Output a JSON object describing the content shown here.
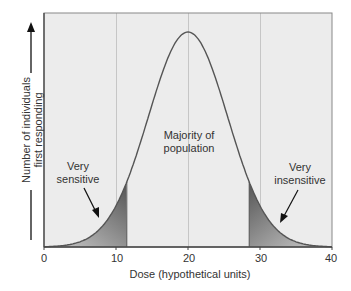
{
  "chart_data": {
    "type": "area",
    "title": "",
    "xlabel": "Dose (hypothetical units)",
    "ylabel_lines": [
      "Number of individuals",
      "first responding"
    ],
    "xlim": [
      0,
      40
    ],
    "x_ticks": [
      0,
      10,
      20,
      30,
      40
    ],
    "x_tick_labels": [
      "0",
      "10",
      "20",
      "30",
      "40"
    ],
    "grid": {
      "vertical": [
        10,
        20,
        30
      ],
      "horizontal": false
    },
    "distribution": {
      "shape": "normal",
      "mean": 20,
      "sd": 5.5
    },
    "shaded_regions": [
      {
        "name": "very-sensitive",
        "from": 0,
        "to": 11.5
      },
      {
        "name": "very-insensitive",
        "from": 28.5,
        "to": 40
      }
    ],
    "annotations": [
      {
        "lines": [
          "Very",
          "sensitive"
        ],
        "target_dose": 7.5
      },
      {
        "lines": [
          "Majority of",
          "population"
        ],
        "target_dose": 20
      },
      {
        "lines": [
          "Very",
          "insensitive"
        ],
        "target_dose": 33
      }
    ],
    "colors": {
      "background": "#ececec",
      "curve": "#555555",
      "shade_dark": "#5e5e5e",
      "shade_light": "#c4c4c4",
      "grid": "#c8c8c8"
    }
  },
  "labels": {
    "x_axis": "Dose (hypothetical units)",
    "y_axis_line1": "Number of individuals",
    "y_axis_line2": "first responding",
    "ticks": [
      "0",
      "10",
      "20",
      "30",
      "40"
    ],
    "sensitive_1": "Very",
    "sensitive_2": "sensitive",
    "majority_1": "Majority of",
    "majority_2": "population",
    "insensitive_1": "Very",
    "insensitive_2": "insensitive"
  }
}
